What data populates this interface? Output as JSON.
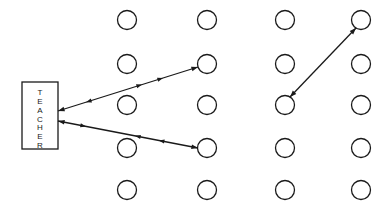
{
  "teacher": {
    "label": "TEACHER",
    "letters": [
      "T",
      "E",
      "A",
      "C",
      "H",
      "E",
      "R"
    ],
    "box": {
      "x": 22,
      "y": 82,
      "w": 36,
      "h": 67
    }
  },
  "students": {
    "columns_x": [
      127,
      207,
      285,
      361
    ],
    "rows_y": [
      20,
      64,
      105,
      148,
      190
    ],
    "radius": 9.5
  },
  "interactions": [
    {
      "from": "teacher",
      "to": "col2-row2",
      "direction": "both",
      "x1": 58,
      "y1": 111,
      "x2": 198,
      "y2": 67,
      "arrowheads_mid": [
        {
          "t": 0.2,
          "dir": "back"
        },
        {
          "t": 0.6,
          "dir": "fwd"
        },
        {
          "t": 0.75,
          "dir": "fwd"
        }
      ]
    },
    {
      "from": "teacher",
      "to": "col2-row4",
      "direction": "both",
      "x1": 58,
      "y1": 121,
      "x2": 198,
      "y2": 148,
      "arrowheads_mid": [
        {
          "t": 0.2,
          "dir": "fwd"
        },
        {
          "t": 0.55,
          "dir": "back"
        },
        {
          "t": 0.72,
          "dir": "back"
        }
      ]
    },
    {
      "from": "col3-row3",
      "to": "col4-row1",
      "direction": "both",
      "x1": 290,
      "y1": 97,
      "x2": 356,
      "y2": 28,
      "arrowheads_mid": []
    }
  ]
}
